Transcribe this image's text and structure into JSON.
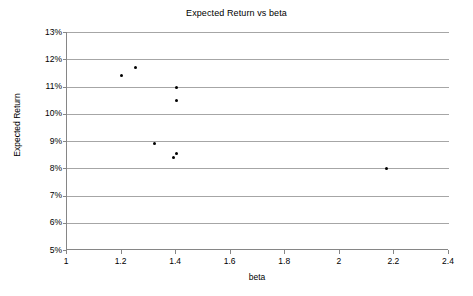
{
  "chart_data": {
    "type": "scatter",
    "title": "Expected Return vs beta",
    "xlabel": "beta",
    "ylabel": "Expected Return",
    "xlim": [
      1,
      2.4
    ],
    "ylim": [
      5,
      13
    ],
    "grid": true,
    "legend": null,
    "xticks": [
      "1",
      "1.2",
      "1.4",
      "1.6",
      "1.8",
      "2",
      "2.2",
      "2.4"
    ],
    "xtick_values": [
      1,
      1.2,
      1.4,
      1.6,
      1.8,
      2.0,
      2.2,
      2.4
    ],
    "yticks": [
      "5%",
      "6%",
      "7%",
      "8%",
      "9%",
      "10%",
      "11%",
      "12%",
      "13%"
    ],
    "ytick_values": [
      5,
      6,
      7,
      8,
      9,
      10,
      11,
      12,
      13
    ],
    "series": [
      {
        "name": "Expected Return",
        "marker": "filled-circle",
        "color": "#000000",
        "points": [
          {
            "x": 1.2,
            "y": 11.4
          },
          {
            "x": 1.25,
            "y": 11.7
          },
          {
            "x": 1.4,
            "y": 10.95
          },
          {
            "x": 1.4,
            "y": 10.5
          },
          {
            "x": 1.32,
            "y": 8.9
          },
          {
            "x": 1.39,
            "y": 8.4
          },
          {
            "x": 1.4,
            "y": 8.55
          },
          {
            "x": 2.17,
            "y": 8.0
          }
        ]
      }
    ],
    "colors": {
      "marker": "#000000",
      "gridline": "#a6a6a6",
      "axis": "#868686",
      "background": "#ffffff",
      "text": "#000000"
    }
  }
}
